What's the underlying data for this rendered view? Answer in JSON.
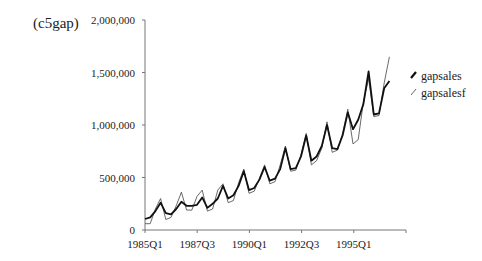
{
  "figure_label": "(c5gap)",
  "chart_data": {
    "type": "line",
    "title": "",
    "panel_label": "(c5gap)",
    "xlabel": "",
    "ylabel": "",
    "ylim": [
      0,
      2000000
    ],
    "yticks": [
      0,
      500000,
      1000000,
      1500000,
      2000000
    ],
    "ytick_labels": [
      "0",
      "500,000",
      "1,000,000",
      "1,500,000",
      "2,000,000"
    ],
    "xtick_labels": [
      "1985Q1",
      "1987Q3",
      "1990Q1",
      "1992Q3",
      "1995Q1"
    ],
    "grid": false,
    "legend_position": "right",
    "x": [
      "1985Q1",
      "1985Q2",
      "1985Q3",
      "1985Q4",
      "1986Q1",
      "1986Q2",
      "1986Q3",
      "1986Q4",
      "1987Q1",
      "1987Q2",
      "1987Q3",
      "1987Q4",
      "1988Q1",
      "1988Q2",
      "1988Q3",
      "1988Q4",
      "1989Q1",
      "1989Q2",
      "1989Q3",
      "1989Q4",
      "1990Q1",
      "1990Q2",
      "1990Q3",
      "1990Q4",
      "1991Q1",
      "1991Q2",
      "1991Q3",
      "1991Q4",
      "1992Q1",
      "1992Q2",
      "1992Q3",
      "1992Q4",
      "1993Q1",
      "1993Q2",
      "1993Q3",
      "1993Q4",
      "1994Q1",
      "1994Q2",
      "1994Q3",
      "1994Q4",
      "1995Q1",
      "1995Q2",
      "1995Q3",
      "1995Q4",
      "1996Q1",
      "1996Q2",
      "1996Q3",
      "1996Q4"
    ],
    "series": [
      {
        "name": "gapsales",
        "style": "thick",
        "values": [
          105000,
          120000,
          180000,
          260000,
          160000,
          150000,
          200000,
          270000,
          230000,
          230000,
          240000,
          310000,
          210000,
          250000,
          300000,
          420000,
          300000,
          330000,
          420000,
          560000,
          380000,
          400000,
          480000,
          600000,
          470000,
          490000,
          580000,
          780000,
          580000,
          590000,
          700000,
          900000,
          660000,
          700000,
          800000,
          1000000,
          780000,
          770000,
          900000,
          1120000,
          960000,
          1050000,
          1200000,
          1510000,
          1100000,
          1110000,
          1350000,
          1420000
        ]
      },
      {
        "name": "gapsalesf",
        "style": "thin",
        "values": [
          60000,
          60000,
          200000,
          300000,
          100000,
          120000,
          230000,
          360000,
          190000,
          190000,
          320000,
          380000,
          180000,
          200000,
          380000,
          440000,
          260000,
          280000,
          450000,
          580000,
          350000,
          370000,
          490000,
          620000,
          440000,
          460000,
          620000,
          800000,
          560000,
          570000,
          720000,
          920000,
          620000,
          660000,
          780000,
          1030000,
          740000,
          760000,
          920000,
          1150000,
          820000,
          860000,
          1220000,
          1440000,
          1080000,
          1090000,
          1400000,
          1650000
        ]
      }
    ]
  },
  "legend": [
    {
      "label": "gapsales"
    },
    {
      "label": "gapsalesf"
    }
  ]
}
